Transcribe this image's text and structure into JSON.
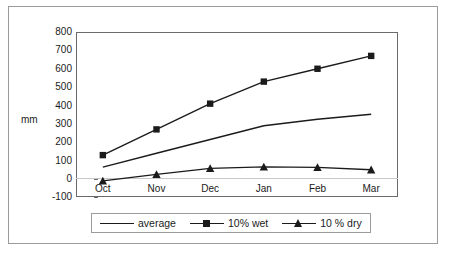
{
  "chart_data": {
    "type": "line",
    "title": "",
    "subtitle": "",
    "xlabel": "",
    "ylabel": "mm",
    "categories": [
      "Oct",
      "Nov",
      "Dec",
      "Jan",
      "Feb",
      "Mar"
    ],
    "ylim": [
      -100,
      800
    ],
    "ytick_step": 100,
    "yticks": [
      800,
      700,
      600,
      500,
      400,
      300,
      200,
      100,
      0,
      -100
    ],
    "ytick_labels": [
      "800",
      "700",
      "600",
      "500",
      "400",
      "300",
      "200",
      "100",
      "0",
      "-100"
    ],
    "grid": false,
    "legend_position": "bottom",
    "series": [
      {
        "name": "average",
        "marker": "none",
        "color": "#1b1b1b",
        "values": [
          65,
          140,
          215,
          290,
          325,
          352
        ]
      },
      {
        "name": "10% wet",
        "marker": "square",
        "color": "#1b1b1b",
        "values": [
          130,
          270,
          410,
          530,
          600,
          670
        ]
      },
      {
        "name": "10 % dry",
        "marker": "triangle",
        "color": "#1b1b1b",
        "values": [
          -10,
          25,
          58,
          66,
          63,
          50
        ]
      }
    ]
  },
  "axis": {
    "y_title": "mm"
  }
}
